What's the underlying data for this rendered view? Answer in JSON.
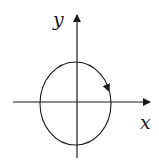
{
  "diagram": {
    "type": "coordinate-plane-ellipse",
    "axes": {
      "x_label": "x",
      "y_label": "y"
    },
    "curve": {
      "shape": "ellipse",
      "direction": "clockwise"
    },
    "colors": {
      "stroke": "#1a1a1a",
      "background": "#ffffff"
    }
  }
}
